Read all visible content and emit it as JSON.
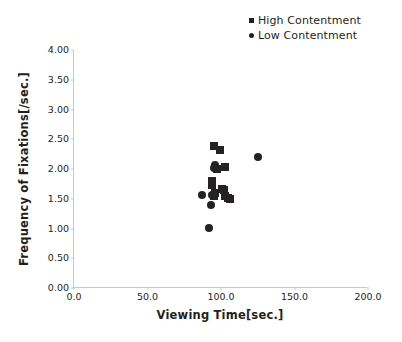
{
  "chart_data": {
    "type": "scatter",
    "title": "",
    "xlabel": "Viewing Time[sec.]",
    "ylabel": "Frequency of Fixations[/sec.]",
    "xlim": [
      0.0,
      200.0
    ],
    "ylim": [
      0.0,
      4.0
    ],
    "xticks": [
      "0.0",
      "50.0",
      "100.0",
      "150.0",
      "200.0"
    ],
    "xtick_values": [
      0.0,
      50.0,
      100.0,
      150.0,
      200.0
    ],
    "yticks": [
      "0.00",
      "0.50",
      "1.00",
      "1.50",
      "2.00",
      "2.50",
      "3.00",
      "3.50",
      "4.00"
    ],
    "ytick_values": [
      0.0,
      0.5,
      1.0,
      1.5,
      2.0,
      2.5,
      3.0,
      3.5,
      4.0
    ],
    "grid": false,
    "legend_position": "top-right",
    "marker_color": "#262223",
    "axis_color": "#c9c9c9",
    "series": [
      {
        "name": "High Contentment",
        "marker": "square",
        "color": "#262223",
        "points": [
          {
            "x": 95.5,
            "y": 2.39
          },
          {
            "x": 99.5,
            "y": 2.32
          },
          {
            "x": 102.5,
            "y": 2.04
          },
          {
            "x": 97.0,
            "y": 2.0
          },
          {
            "x": 94.0,
            "y": 1.79
          },
          {
            "x": 94.0,
            "y": 1.73
          },
          {
            "x": 96.0,
            "y": 1.59
          },
          {
            "x": 95.0,
            "y": 1.54
          },
          {
            "x": 100.5,
            "y": 1.67
          },
          {
            "x": 102.0,
            "y": 1.64
          },
          {
            "x": 103.0,
            "y": 1.54
          },
          {
            "x": 105.0,
            "y": 1.52
          },
          {
            "x": 106.0,
            "y": 1.5
          }
        ]
      },
      {
        "name": "Low Contentment",
        "marker": "circle",
        "color": "#262223",
        "points": [
          {
            "x": 125.0,
            "y": 2.21
          },
          {
            "x": 96.0,
            "y": 2.07
          },
          {
            "x": 95.0,
            "y": 2.01
          },
          {
            "x": 87.0,
            "y": 1.57
          },
          {
            "x": 94.0,
            "y": 1.56
          },
          {
            "x": 93.0,
            "y": 1.4
          },
          {
            "x": 92.0,
            "y": 1.01
          }
        ]
      }
    ]
  },
  "legend": {
    "items": [
      {
        "label": "High Contentment",
        "marker": "square"
      },
      {
        "label": "Low Contentment",
        "marker": "circle"
      }
    ]
  }
}
